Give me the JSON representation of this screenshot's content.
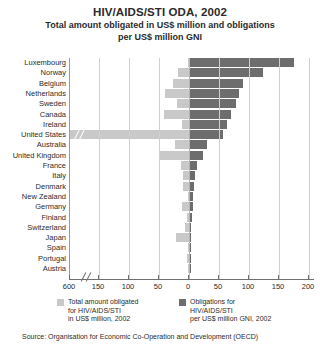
{
  "chart_data": {
    "type": "bar",
    "orientation": "horizontal-diverging",
    "title": "HIV/AIDS/STI ODA, 2002",
    "subtitle_line1": "Total amount obligated in US$ million and obligations",
    "subtitle_line2": "per US$ million GNI",
    "xlabel": "",
    "ylabel": "",
    "grid": true,
    "legend_position": "bottom",
    "axis_break_left": true,
    "axis_break_note": "600",
    "xlim_left": [
      0,
      200
    ],
    "xlim_right": [
      0,
      200
    ],
    "x_ticks_left": [
      "600",
      "150",
      "100",
      "50"
    ],
    "x_ticks_right": [
      "0",
      "50",
      "100",
      "150",
      "200"
    ],
    "categories": [
      "Luxembourg",
      "Norway",
      "Belgium",
      "Netherlands",
      "Sweden",
      "Canada",
      "Ireland",
      "United States",
      "Australia",
      "United Kingdom",
      "France",
      "Italy",
      "Denmark",
      "New Zealand",
      "Germany",
      "Finland",
      "Switzerland",
      "Japan",
      "Spain",
      "Portugal",
      "Austria"
    ],
    "series": [
      {
        "name": "Total amount obligated for HIV/AIDS/STI in US$ million, 2002",
        "direction": "left",
        "color": "#c9c9c9",
        "values": [
          2,
          19,
          27,
          40,
          20,
          42,
          12,
          595,
          24,
          50,
          13,
          10,
          10,
          2,
          12,
          4,
          6,
          22,
          2,
          3,
          1
        ]
      },
      {
        "name": "Obligations for HIV/AIDS/STI per US$ million GNI, 2002",
        "direction": "right",
        "color": "#6d6d6d",
        "values": [
          175,
          123,
          90,
          83,
          78,
          70,
          63,
          57,
          30,
          23,
          13,
          10,
          8,
          7,
          6,
          5,
          4,
          3,
          3,
          2,
          2
        ]
      }
    ]
  },
  "legend": {
    "items": [
      {
        "swatch": "light",
        "line1": "Total amount obligated",
        "line2": "for HIV/AIDS/STI",
        "line3": "in US$ million, 2002"
      },
      {
        "swatch": "dark",
        "line1": "Obligations for",
        "line2": "HIV/AIDS/STI",
        "line3": "per US$ million GNI, 2002"
      }
    ]
  },
  "source": {
    "text": "Source: Organisation for Economic Co-Operation and Development (OECD)"
  },
  "colors": {
    "bar_light": "#c9c9c9",
    "bar_dark": "#6d6d6d",
    "gridline": "#cfcfcf",
    "axis": "#6f6f6f",
    "text": "#2b2b2b"
  }
}
